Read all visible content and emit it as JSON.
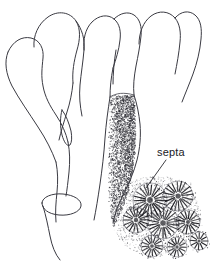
{
  "figure": {
    "domain": "scientific-illustration",
    "width": 210,
    "height": 272,
    "background_color": "#ffffff",
    "ink_color": "#3a3a42",
    "label_color": "#1a1a1f",
    "stipple_color": "#2e2e35"
  },
  "labels": [
    {
      "id": "septa",
      "text": "septa",
      "x": 157,
      "y": 156,
      "font_size": 11,
      "leader_from": [
        166,
        160
      ],
      "leader_to": [
        146,
        188
      ]
    }
  ],
  "parts": {
    "colony_label": "branching colony outline",
    "stippled_branch_label": "stippled branch",
    "basal_collar_label": "basal collar ring",
    "detail_label": "corallite detail",
    "stalk_label": "basal stalk"
  },
  "branch_outlines": [
    {
      "name": "branch-left-outer",
      "path": "M 8 52 C 13 41 22 36 31 38 C 40 40 44 49 43 58 C 42 68 41 76 43 86 C 45 97 50 106 56 115 C 62 124 66 133 68 142"
    },
    {
      "name": "branch-left-outer-inner",
      "path": "M 8 52 C 4 62 6 74 12 86 C 19 99 29 113 38 127 C 46 139 52 151 56 162"
    },
    {
      "name": "branch-second-left",
      "path": "M 34 47 C 33 36 38 24 48 17 C 58 10 70 12 76 21 C 81 29 80 40 77 50 C 74 61 72 72 73 83"
    },
    {
      "name": "branch-second-left-right",
      "path": "M 76 21 C 82 29 85 39 84 50 C 83 62 81 74 80 85 C 79 96 80 106 82 116"
    },
    {
      "name": "branch-middle-notch",
      "path": "M 73 83 C 72 93 70 103 67 112 C 64 122 61 131 59 140"
    },
    {
      "name": "branch-third",
      "path": "M 84 50 C 83 40 85 29 92 22 C 99 15 108 14 114 19 C 120 24 121 32 120 40 C 119 50 116 59 113 68"
    },
    {
      "name": "branch-third-right",
      "path": "M 114 19 C 120 13 128 11 134 15 C 140 19 142 27 141 36 C 140 46 138 56 136 66 C 134 77 133 86 134 95"
    },
    {
      "name": "branch-fourth",
      "path": "M 113 68 C 111 78 110 88 110 97"
    },
    {
      "name": "branch-fifth-right",
      "path": "M 139 44 C 139 33 143 22 151 16 C 159 10 169 11 175 18 C 180 24 181 33 180 42 C 179 53 177 64 175 74"
    },
    {
      "name": "branch-fifth-right-outer",
      "path": "M 175 18 C 181 11 189 10 195 15 C 201 20 202 29 201 39 C 200 51 197 63 193 74 C 189 85 185 94 182 102"
    },
    {
      "name": "branch-collar-left",
      "path": "M 116 50 C 114 62 113 74 113 84"
    },
    {
      "name": "stalk-main-left",
      "path": "M 56 162 C 58 172 58 182 57 192 C 56 202 55 212 56 222"
    },
    {
      "name": "stalk-main-right",
      "path": "M 68 142 C 70 152 70 162 69 172 C 68 182 67 190 66 196"
    },
    {
      "name": "stalk-lower",
      "path": "M 43 206 C 46 216 48 226 50 236 C 52 246 55 254 60 260"
    },
    {
      "name": "leaf-spur",
      "path": "M 62 110 C 66 115 69 123 71 131 C 72 137 72 142 70 145 C 67 147 64 142 62 135 C 60 127 60 117 62 110 Z"
    },
    {
      "name": "basal-collar",
      "path": "M 42 203 C 42 197 52 193 63 194 C 74 195 82 200 81 206 C 80 212 70 216 59 215 C 48 214 42 209 42 203 Z"
    }
  ],
  "stippled_branch": {
    "name": "stippled-branch",
    "outline_left": "M 110 97 C 108 110 106 124 105 138 C 104 154 102 170 100 184 C 98 198 96 210 94 220",
    "outline_right": "M 134 95 C 137 104 139 114 140 124 C 141 136 140 148 137 160 C 134 172 129 183 124 193 C 119 203 115 213 113 223",
    "top_edge": "M 110 97 C 116 93 124 92 134 95"
  },
  "corallite_detail": {
    "name": "corallite-detail-cluster",
    "center_x": 156,
    "center_y": 216,
    "corallites": [
      {
        "cx": 150,
        "cy": 200,
        "r": 17,
        "septa_count": 22
      },
      {
        "cx": 178,
        "cy": 196,
        "r": 15,
        "septa_count": 20
      },
      {
        "cx": 163,
        "cy": 223,
        "r": 16,
        "septa_count": 22
      },
      {
        "cx": 136,
        "cy": 220,
        "r": 13,
        "septa_count": 18
      },
      {
        "cx": 188,
        "cy": 222,
        "r": 12,
        "septa_count": 16
      },
      {
        "cx": 152,
        "cy": 246,
        "r": 11,
        "septa_count": 16
      },
      {
        "cx": 177,
        "cy": 247,
        "r": 10,
        "septa_count": 14
      },
      {
        "cx": 199,
        "cy": 241,
        "r": 9,
        "septa_count": 12
      }
    ]
  }
}
